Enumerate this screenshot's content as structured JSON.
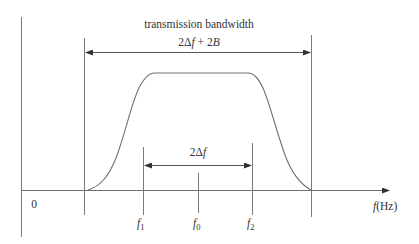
{
  "diagram": {
    "title": "transmission bandwidth",
    "outer_span_label": {
      "coef": "2",
      "delta": "Δ",
      "f": "f",
      "plus": " + 2",
      "B": "B"
    },
    "inner_span_label": {
      "coef": "2",
      "delta": "Δ",
      "f": "f"
    },
    "origin_label": "0",
    "axis_label": {
      "f": "f",
      "unit": "(Hz)"
    },
    "ticks": [
      {
        "name": "f",
        "sub": "1"
      },
      {
        "name": "f",
        "sub": "0"
      },
      {
        "name": "f",
        "sub": "2"
      }
    ],
    "colors": {
      "line": "#6e6e6e",
      "curve": "#707070",
      "text": "#333333",
      "background": "#ffffff"
    }
  }
}
